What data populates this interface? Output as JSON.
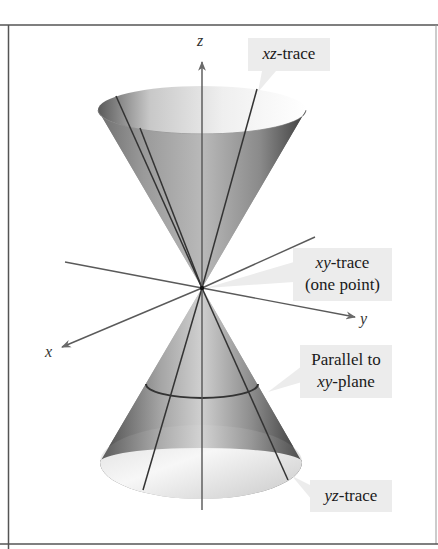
{
  "figure": {
    "axes": {
      "z_label": "z",
      "y_label": "y",
      "x_label": "x"
    },
    "callouts": {
      "xz_trace": {
        "var": "xz",
        "suffix": "-trace"
      },
      "xy_trace": {
        "var": "xy",
        "suffix": "-trace",
        "line2": "(one point)"
      },
      "parallel": {
        "line1": "Parallel to",
        "var": "xy",
        "suffix": "-plane"
      },
      "yz_trace": {
        "var": "yz",
        "suffix": "-trace"
      }
    },
    "colors": {
      "frame": "#555555",
      "axis": "#5a5a5a",
      "callout_bg": "#ececec",
      "cone_dark": "#3a3a3a",
      "cone_light": "#f2f2f2"
    }
  }
}
